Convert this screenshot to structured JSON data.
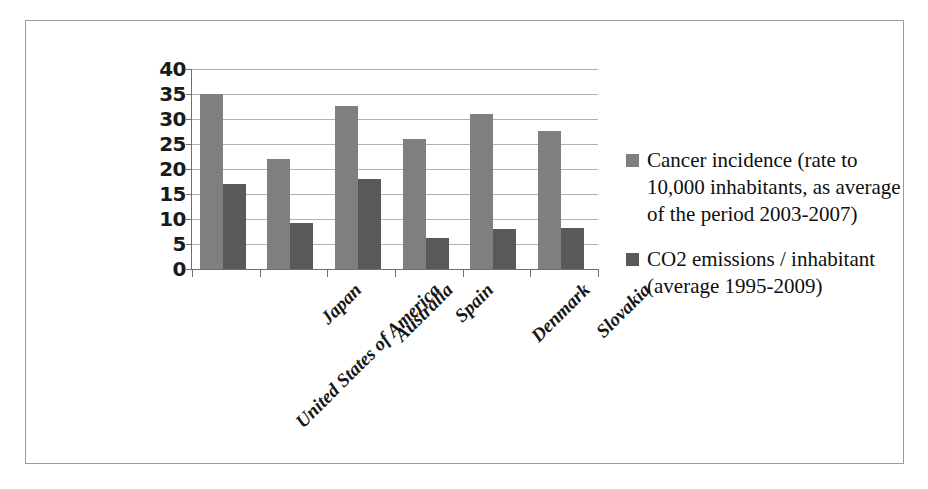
{
  "chart_data": {
    "type": "bar",
    "title": "",
    "subtitle": "",
    "xlabel": "",
    "ylabel": "",
    "ylim": [
      0,
      40
    ],
    "y_ticks": [
      0,
      5,
      10,
      15,
      20,
      25,
      30,
      35,
      40
    ],
    "y_tick_labels": [
      "0",
      "5",
      "10",
      "15",
      "20",
      "25",
      "30",
      "35",
      "40"
    ],
    "grid": true,
    "legend_position": "right",
    "orientation": "vertical",
    "categories": [
      "United States of America",
      "Japan",
      "Australia",
      "Spain",
      "Denmark",
      "Slovakia"
    ],
    "category_label_rotation": -45,
    "series": [
      {
        "name": "Cancer incidence (rate to 10,000 inhabitants, as average of the period 2003-2007)",
        "color": "#7f7f7f",
        "values": [
          35,
          22,
          32.7,
          26,
          31,
          27.7
        ]
      },
      {
        "name": "CO2 emissions / inhabitant (average 1995-2009)",
        "color": "#595959",
        "values": [
          17,
          9.3,
          18,
          6.2,
          8,
          8.2
        ]
      }
    ]
  },
  "legend": {
    "entries": [
      {
        "label": "Cancer incidence (rate to 10,000 inhabitants, as average of the period 2003-2007)",
        "color": "#7f7f7f"
      },
      {
        "label": "CO2 emissions / inhabitant (average 1995-2009)",
        "color": "#595959"
      }
    ]
  },
  "colors": {
    "series_light": "#7f7f7f",
    "series_dark": "#595959",
    "gridline": "#b0b0b0",
    "axis": "#6e6e6e",
    "frame": "#9a9a9a",
    "background": "#ffffff",
    "text": "#161616"
  }
}
